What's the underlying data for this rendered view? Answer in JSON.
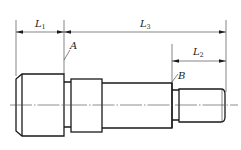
{
  "drawing": {
    "type": "stepped shaft dimension drawing",
    "dimensions": [
      {
        "id": "L1",
        "label": "L",
        "subscript": "1"
      },
      {
        "id": "L3",
        "label": "L",
        "subscript": "3"
      },
      {
        "id": "L2",
        "label": "L",
        "subscript": "2"
      }
    ],
    "reference_points": [
      {
        "id": "A",
        "label": "A"
      },
      {
        "id": "B",
        "label": "B"
      }
    ],
    "colors": {
      "line": "#1a1a1a",
      "background": "#ffffff"
    }
  }
}
